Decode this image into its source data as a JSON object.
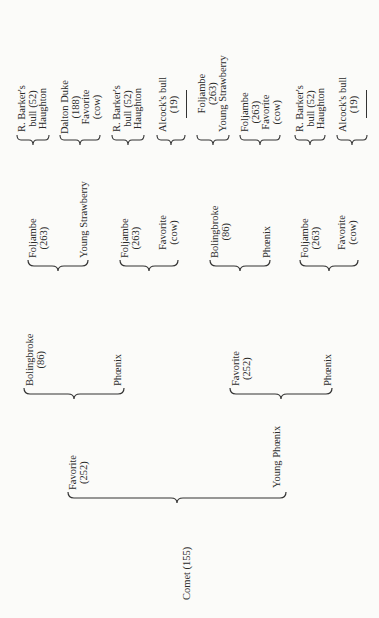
{
  "pedigree": {
    "root": {
      "name": "Comet (155)"
    },
    "sire": {
      "name": "Favorite",
      "number": "(252)"
    },
    "dam": {
      "name": "Young Phœnix"
    },
    "sire_sire": {
      "name": "Bolingbroke",
      "number": "(86)"
    },
    "sire_dam": {
      "name": "Phœnix"
    },
    "dam_sire": {
      "name": "Favorite",
      "number": "(252)"
    },
    "dam_dam": {
      "name": "Phœnix"
    },
    "level3": [
      {
        "top": [
          "Foljambe",
          "(263)"
        ],
        "bottom": [
          "Young Strawberry"
        ]
      },
      {
        "top": [
          "Foljambe",
          "(263)"
        ],
        "bottom": [
          "Favorite",
          "(cow)"
        ]
      },
      {
        "top": [
          "Bolingbroke",
          "(86)"
        ],
        "bottom": [
          "Phœnix"
        ]
      },
      {
        "top": [
          "Foljambe",
          "(263)"
        ],
        "bottom": [
          "Favorite",
          "(cow)"
        ]
      }
    ],
    "level4": [
      {
        "lines": [
          "R. Barker's",
          "bull (52)",
          "Haughton"
        ]
      },
      {
        "lines": [
          "Dalton Duke",
          "(188)",
          "Favorite",
          "(cow)"
        ]
      },
      {
        "lines": [
          "R. Barker's",
          "bull (52)",
          "Haughton"
        ]
      },
      {
        "lines": [
          "Alcock's bull",
          "(19)"
        ],
        "blank": true
      },
      {
        "lines": [
          "Foljambe",
          "(263)",
          "Young Strawberry"
        ]
      },
      {
        "lines": [
          "Foljambe",
          "(263)",
          "Favorite",
          "(cow)"
        ]
      },
      {
        "lines": [
          "R. Barker's",
          "bull (52)",
          "Haughton"
        ]
      },
      {
        "lines": [
          "Alcock's bull",
          "(19)"
        ],
        "blank": true
      }
    ]
  }
}
